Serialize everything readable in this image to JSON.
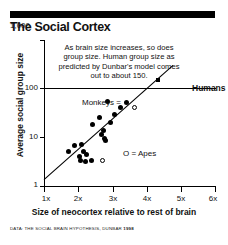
{
  "header": {
    "title": "The Social Cortex"
  },
  "annotation": {
    "text": "As brain size increases, so does group size. Human group size as predicted by Dunbar's model comes out to about 150."
  },
  "legend": {
    "monkeys": "Monkeys =",
    "apes": "O = Apes",
    "humans": "Humans"
  },
  "source": {
    "prefix": "DATA: THE SOCIAL BRAIN HYPOTHESIS, DUNBAR",
    "year": "1998"
  },
  "chart_data": {
    "type": "scatter",
    "title": "The Social Cortex",
    "xlabel": "Size of neocortex relative to rest of brain",
    "ylabel": "Average social group size",
    "xlim": [
      1,
      6
    ],
    "ylim": [
      1,
      1000
    ],
    "yscale": "log",
    "xticks": [
      "1x",
      "2x",
      "3x",
      "4x",
      "5x",
      "6x"
    ],
    "xtick_values": [
      1,
      2,
      3,
      4,
      5,
      6
    ],
    "yticks": [
      "1",
      "10",
      "100",
      "1,000"
    ],
    "ytick_values": [
      1,
      10,
      100,
      1000
    ],
    "grid": "horizontal gridline at y=100 only",
    "legend_position": "inside plot",
    "series": [
      {
        "name": "Monkeys",
        "marker": "filled-circle",
        "points": [
          [
            1.72,
            5.0
          ],
          [
            1.9,
            6.8
          ],
          [
            2.02,
            4.0
          ],
          [
            2.06,
            3.4
          ],
          [
            2.1,
            7.2
          ],
          [
            2.14,
            5.2
          ],
          [
            2.2,
            3.2
          ],
          [
            2.23,
            4.4
          ],
          [
            2.38,
            3.3
          ],
          [
            2.42,
            18.0
          ],
          [
            2.62,
            25.0
          ],
          [
            2.66,
            11.5
          ],
          [
            2.72,
            13.5
          ],
          [
            2.76,
            9.5
          ],
          [
            2.8,
            8.6
          ],
          [
            2.86,
            55.0
          ],
          [
            2.92,
            20.0
          ],
          [
            3.05,
            30.0
          ],
          [
            3.22,
            42.0
          ]
        ]
      },
      {
        "name": "Apes",
        "marker": "open-circle",
        "points": [
          [
            2.7,
            3.3
          ],
          [
            3.62,
            42.0
          ]
        ]
      },
      {
        "name": "Humans",
        "marker": "filled-square",
        "points": [
          [
            4.3,
            150.0
          ]
        ]
      }
    ],
    "trendline": {
      "description": "regression line of group size on neocortex ratio",
      "start": [
        1.0,
        1.35
      ],
      "end": [
        4.75,
        300.0
      ]
    }
  }
}
